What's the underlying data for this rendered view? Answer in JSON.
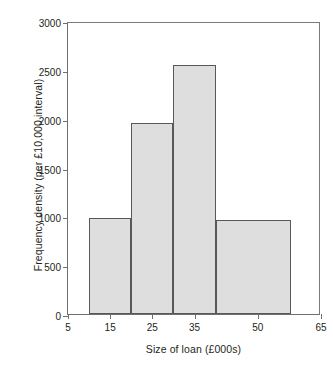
{
  "chart_data": {
    "type": "bar",
    "title": "",
    "subtitle": "",
    "xlabel": "Size of loan (£000s)",
    "ylabel": "Frequency density (per £10,000 interval)",
    "xlim": [
      5,
      65
    ],
    "ylim": [
      0,
      3000
    ],
    "grid": false,
    "legend": null,
    "x_ticks": [
      {
        "value": 5,
        "label": "5"
      },
      {
        "value": 15,
        "label": "15"
      },
      {
        "value": 25,
        "label": "25"
      },
      {
        "value": 35,
        "label": "35"
      },
      {
        "value": 50,
        "label": "50"
      },
      {
        "value": 65,
        "label": "65"
      }
    ],
    "y_ticks": [
      {
        "value": 0,
        "label": "0"
      },
      {
        "value": 500,
        "label": "500"
      },
      {
        "value": 1000,
        "label": "1000"
      },
      {
        "value": 1500,
        "label": "1500"
      },
      {
        "value": 2000,
        "label": "2000"
      },
      {
        "value": 2500,
        "label": "2500"
      },
      {
        "value": 3000,
        "label": "3000"
      }
    ],
    "bins": [
      {
        "x0": 10,
        "x1": 20,
        "value": 985
      },
      {
        "x0": 20,
        "x1": 30,
        "value": 1955
      },
      {
        "x0": 30,
        "x1": 40,
        "value": 2545
      },
      {
        "x0": 40,
        "x1": 58,
        "value": 960
      }
    ],
    "categories": [
      "10–20",
      "20–30",
      "30–40",
      "40–58"
    ],
    "values": [
      985,
      1955,
      2545,
      960
    ],
    "colors": {
      "bar_fill": "#dedede",
      "bar_edge": "#58585a",
      "axis": "#6f6f6f",
      "text": "#231f20",
      "background": "#ffffff"
    }
  }
}
